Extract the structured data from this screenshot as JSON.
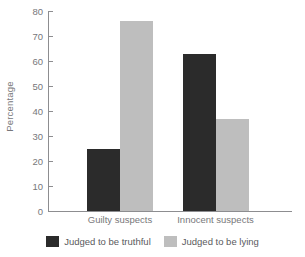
{
  "chart_data": {
    "type": "bar",
    "title": "",
    "xlabel": "",
    "ylabel": "Percentage",
    "categories": [
      "Guilty suspects",
      "Innocent suspects"
    ],
    "series": [
      {
        "name": "Judged to be truthful",
        "color": "#2b2b2b",
        "values": [
          25,
          63
        ]
      },
      {
        "name": "Judged to be lying",
        "color": "#bebebe",
        "values": [
          76,
          37
        ]
      }
    ],
    "ylim": [
      0,
      80
    ],
    "yticks": [
      0,
      10,
      20,
      30,
      40,
      50,
      60,
      70,
      80
    ],
    "ytick_labels": [
      "0",
      "10",
      "20",
      "30",
      "40",
      "50",
      "60",
      "70",
      "80"
    ],
    "grid": false,
    "legend_position": "bottom-center",
    "axis_color": "#8d8d90",
    "tick_label_color": "#77777a"
  }
}
